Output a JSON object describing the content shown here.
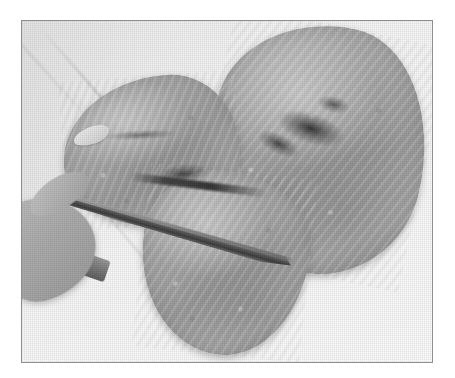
{
  "page": {
    "background_color": "#ffffff",
    "width": 455,
    "height": 378
  },
  "photo": {
    "frame": {
      "border_color": "#8e8e8e",
      "border_width_px": 1,
      "left": 21,
      "top": 20,
      "width": 412,
      "height": 343
    },
    "caption": "",
    "alt_text": "Grayscale photograph of two raw chicken breasts on a white cutting board; a hand holds a chef's knife slicing the left breast in half.",
    "palette": {
      "board_white": "#f7f7f7",
      "paper_white": "#ffffff",
      "meat_midtone": "#a9a9a9",
      "meat_highlight": "#d2d2d2",
      "meat_shadow": "#8a8a8a",
      "tendon_dark": "#2d2d2d",
      "knife_blade": "#4a4a4a",
      "knife_handle": "#7d7d7d",
      "hand_tone": "#b2b2b2"
    },
    "subjects": [
      {
        "name": "chicken-breast-right",
        "description": "whole chicken breast, upper right, tilted"
      },
      {
        "name": "chicken-breast-left-upper",
        "description": "upper half of the left chicken breast"
      },
      {
        "name": "chicken-breast-left-lower",
        "description": "lower cut-off half of the left chicken breast"
      },
      {
        "name": "chef-knife",
        "description": "knife blade crossing the left breast diagonally"
      },
      {
        "name": "hand",
        "description": "hand gripping the knife handle at lower left"
      },
      {
        "name": "cutting-board",
        "description": "white cutting board surface"
      }
    ]
  }
}
